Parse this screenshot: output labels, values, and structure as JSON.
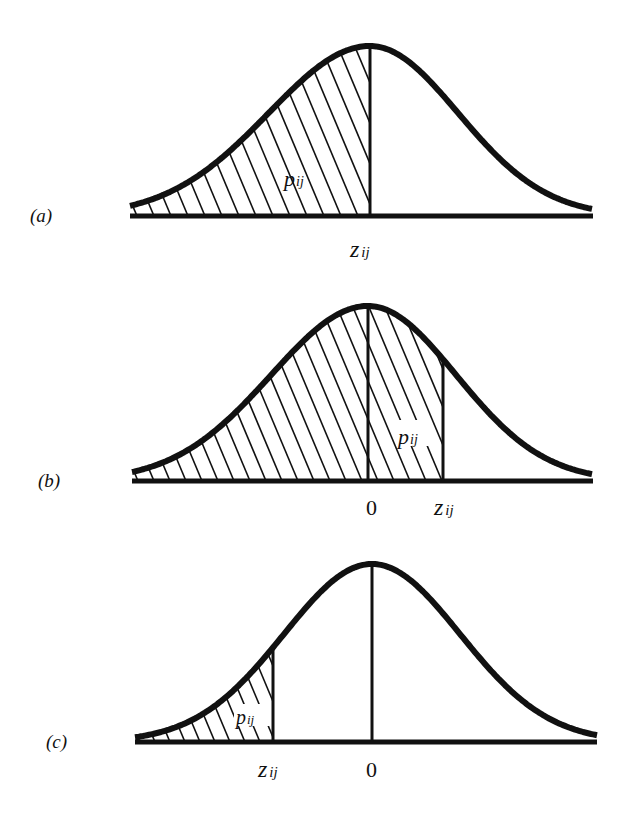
{
  "panels": [
    {
      "id": "a",
      "label": "(a)",
      "area_label": "pij",
      "area_label_main": "p",
      "area_label_sub": "ij",
      "axis_labels": [
        {
          "main": "z",
          "sub": "ij",
          "position": "center"
        }
      ],
      "shaded_region": "from left tail up to z_ij (z_ij at mean)"
    },
    {
      "id": "b",
      "label": "(b)",
      "area_label_main": "p",
      "area_label_sub": "ij",
      "axis_labels": [
        {
          "main": "0",
          "sub": "",
          "position": "mean"
        },
        {
          "main": "z",
          "sub": "ij",
          "position": "right of mean"
        }
      ],
      "shaded_region": "from left tail up to z_ij (z_ij > 0)"
    },
    {
      "id": "c",
      "label": "(c)",
      "area_label_main": "p",
      "area_label_sub": "ij",
      "axis_labels": [
        {
          "main": "z",
          "sub": "ij",
          "position": "left of mean"
        },
        {
          "main": "0",
          "sub": "",
          "position": "mean"
        }
      ],
      "shaded_region": "from left tail up to z_ij (z_ij < 0)"
    }
  ],
  "colors": {
    "ink": "#111111",
    "background": "#ffffff"
  }
}
